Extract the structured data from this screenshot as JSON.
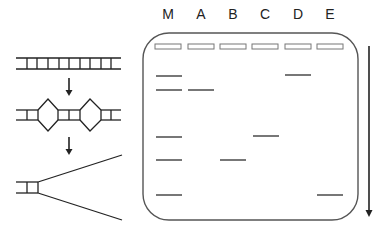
{
  "diagram": {
    "title": "",
    "steps": [
      {
        "id": "intact-dna",
        "description": "double-stranded DNA"
      },
      {
        "id": "partial-denaturation",
        "description": "DNA with denaturation bubbles"
      },
      {
        "id": "strand-separation",
        "description": "separated strands"
      }
    ],
    "gel": {
      "lanes": [
        {
          "label": "M",
          "x": 155,
          "bands": [
            76,
            90,
            137,
            160,
            195
          ]
        },
        {
          "label": "A",
          "x": 188,
          "bands": [
            90
          ]
        },
        {
          "label": "B",
          "x": 220,
          "bands": [
            160
          ]
        },
        {
          "label": "C",
          "x": 252,
          "bands": [
            136
          ]
        },
        {
          "label": "D",
          "x": 285,
          "bands": [
            75
          ]
        },
        {
          "label": "E",
          "x": 317,
          "bands": [
            195
          ]
        }
      ],
      "migration_direction": "down"
    },
    "colors": {
      "line": "#222222",
      "gel_border": "#555555",
      "band": "#777777",
      "well": "#777777"
    }
  }
}
